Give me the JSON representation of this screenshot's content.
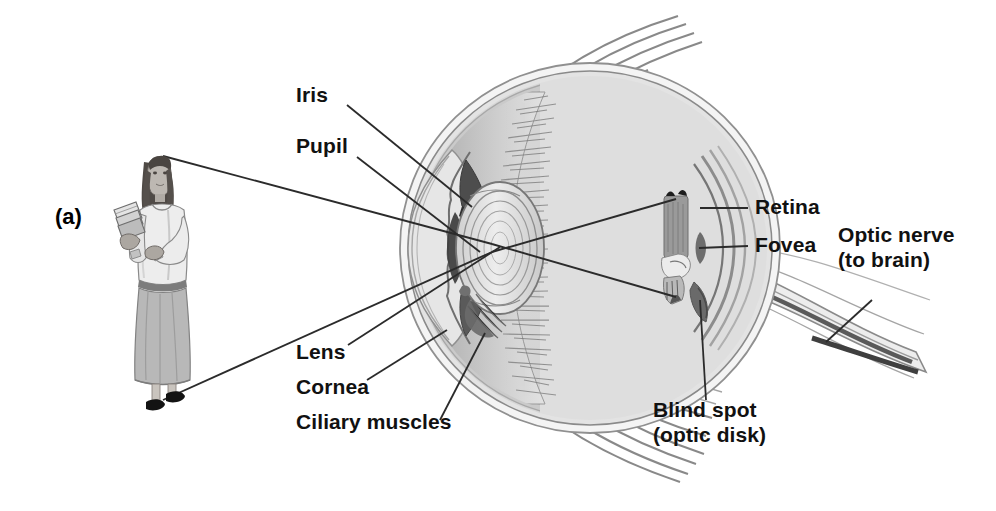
{
  "figure": {
    "panel_label": "(a)"
  },
  "labels": {
    "iris": "Iris",
    "pupil": "Pupil",
    "lens": "Lens",
    "cornea": "Cornea",
    "ciliary_muscles": "Ciliary muscles",
    "retina": "Retina",
    "fovea": "Fovea",
    "optic_nerve_line1": "Optic nerve",
    "optic_nerve_line2": "(to brain)",
    "blind_spot_line1": "Blind spot",
    "blind_spot_line2": "(optic disk)"
  },
  "colors": {
    "ink": "#111111",
    "leader_line": "#2b2b2b",
    "sclera_outer": "#f2f2f2",
    "sclera_mid": "#d9d9d9",
    "choroid": "#9a9a9a",
    "vitreous": "#d6d6d6",
    "vitreous_light": "#e8e8e8",
    "iris_dark": "#4a4a4a",
    "lens_fill": "#dcdcdc",
    "muscle_strand": "#6e6e6e",
    "figure_skin": "#b9b4ae",
    "figure_hair": "#4f4a46",
    "figure_top": "#ececec",
    "figure_skirt": "#b5b5b5",
    "figure_shoe": "#1b1b1b",
    "background": "#ffffff"
  }
}
